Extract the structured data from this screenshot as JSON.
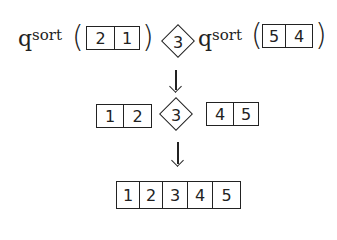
{
  "diagram": {
    "colors": {
      "ink": "#222222",
      "background": "#ffffff"
    },
    "step1": {
      "left_call": {
        "function": "qsort",
        "q": "q",
        "sort": "sort",
        "open": "(",
        "close": ")",
        "cells": [
          "2",
          "1"
        ]
      },
      "pivot": "3",
      "right_call": {
        "function": "qsort",
        "q": "q",
        "sort": "sort",
        "open": "(",
        "close": ")",
        "cells": [
          "5",
          "4"
        ]
      }
    },
    "step2": {
      "left_array": [
        "1",
        "2"
      ],
      "pivot": "3",
      "right_array": [
        "4",
        "5"
      ]
    },
    "step3": {
      "result_array": [
        "1",
        "2",
        "3",
        "4",
        "5"
      ]
    }
  }
}
